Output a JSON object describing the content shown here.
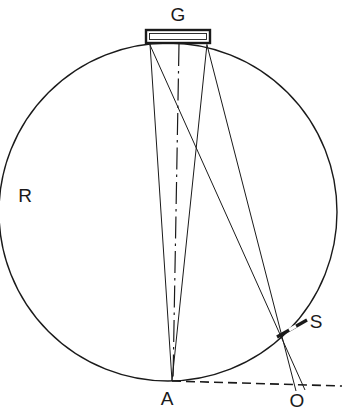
{
  "figure": {
    "background_color": "#ffffff",
    "line_color": "#1a1a1a",
    "labels": {
      "grating": "G",
      "circle": "R",
      "focus": "A",
      "slit": "S",
      "origin": "O"
    },
    "label_positions": {
      "grating": {
        "x": 178,
        "y": 21
      },
      "circle": {
        "x": 25,
        "y": 202
      },
      "focus": {
        "x": 167,
        "y": 405
      },
      "slit": {
        "x": 316,
        "y": 328
      },
      "origin": {
        "x": 297,
        "y": 407
      }
    },
    "geometry": {
      "circle": {
        "cx": 168,
        "cy": 212,
        "r": 169
      },
      "grating_rect": {
        "x": 146,
        "y": 30,
        "width": 64,
        "height": 13
      },
      "point_A": {
        "x": 172,
        "y": 381
      },
      "point_S": {
        "x": 293,
        "y": 327
      },
      "point_O": {
        "x": 300,
        "y": 388
      },
      "grating_left": {
        "x": 150,
        "y": 44
      },
      "grating_center": {
        "x": 179,
        "y": 44
      },
      "grating_right": {
        "x": 207,
        "y": 44
      }
    },
    "elements": [
      {
        "name": "rowland-circle",
        "kind": "circle",
        "label": "R"
      },
      {
        "name": "diffraction-grating",
        "kind": "rectangle",
        "label": "G"
      },
      {
        "name": "optical-axis",
        "kind": "dash-dot-line"
      },
      {
        "name": "ray-bundle-to-focus",
        "kind": "converging-rays",
        "target": "A"
      },
      {
        "name": "ray-bundle-to-slit",
        "kind": "converging-rays",
        "target": "S"
      },
      {
        "name": "slit-marker",
        "kind": "thick-segment",
        "label": "S"
      },
      {
        "name": "baseline",
        "kind": "dashed-line",
        "from": "A",
        "to": "O"
      }
    ]
  }
}
